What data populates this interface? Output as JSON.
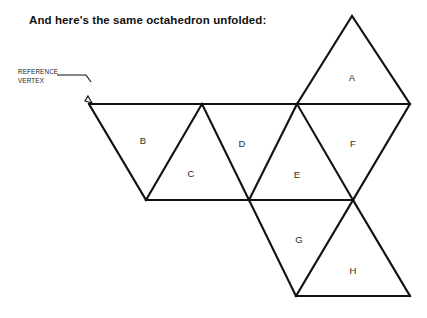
{
  "page": {
    "title": "And here's the same octahedron unfolded:",
    "background_color": "#ffffff",
    "ink_color": "#111111"
  },
  "annotation": {
    "reference_vertex_line1": "REFERENCE",
    "reference_vertex_line2": "VERTEX"
  },
  "figure": {
    "name": "octahedron-net",
    "faces": [
      {
        "id": "A",
        "label": "A",
        "orientation": "up",
        "label_x": 352,
        "label_y": 78
      },
      {
        "id": "B",
        "label": "B",
        "orientation": "down",
        "label_x": 143,
        "label_y": 141
      },
      {
        "id": "C",
        "label": "C",
        "orientation": "up",
        "label_x": 191,
        "label_y": 174
      },
      {
        "id": "D",
        "label": "D",
        "orientation": "down",
        "label_x": 242,
        "label_y": 144
      },
      {
        "id": "E",
        "label": "E",
        "orientation": "up",
        "label_x": 297,
        "label_y": 175
      },
      {
        "id": "F",
        "label": "F",
        "orientation": "down",
        "label_x": 353,
        "label_y": 144
      },
      {
        "id": "G",
        "label": "G",
        "orientation": "down",
        "label_x": 299,
        "label_y": 240
      },
      {
        "id": "H",
        "label": "H",
        "orientation": "up",
        "label_x": 353,
        "label_y": 271
      }
    ]
  }
}
